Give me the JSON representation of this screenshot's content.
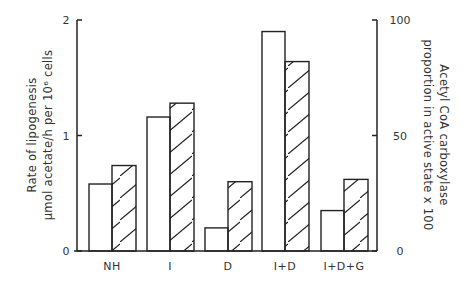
{
  "chart_data": {
    "type": "bar",
    "title": "",
    "categories": [
      "NH",
      "I",
      "D",
      "I+D",
      "I+D+G"
    ],
    "series": [
      {
        "name": "Rate of lipogenesis",
        "style": "open",
        "axis": "left",
        "values": [
          0.58,
          1.16,
          0.2,
          1.9,
          0.35
        ]
      },
      {
        "name": "Acetyl CoA carboxylase proportion in active state x 100",
        "style": "hatched",
        "axis": "right",
        "values": [
          37,
          64,
          30,
          82,
          31
        ]
      }
    ],
    "xlabel": "",
    "ylabel": "Rate of lipogenesis",
    "ylabel_sub": "μmol acetate/h per 10⁶ cells",
    "ylabel_right": "Acetyl CoA carboxylase",
    "ylabel_right_sub": "proportion in active state x 100",
    "ylim": [
      0,
      2
    ],
    "ylim_right": [
      0,
      100
    ],
    "yticks": [
      "0",
      "1",
      "2"
    ],
    "yticks_right": [
      "0",
      "50",
      "100"
    ],
    "grid": false,
    "legend": "none"
  }
}
